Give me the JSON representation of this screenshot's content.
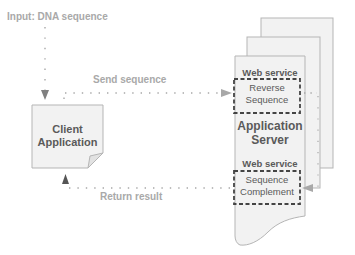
{
  "labels": {
    "input": "Input: DNA sequence",
    "send": "Send sequence",
    "return": "Return result"
  },
  "client": {
    "line1": "Client",
    "line2": "Application"
  },
  "server": {
    "line1": "Application",
    "line2": "Server",
    "services": [
      {
        "header": "Web service",
        "line1": "Reverse",
        "line2": "Sequence"
      },
      {
        "header": "Web service",
        "line1": "Sequence",
        "line2": "Complement"
      }
    ]
  },
  "colors": {
    "page_fill": "#f2f2f2",
    "page_stroke": "#b5b5b5",
    "label_gray": "#a9a9a9",
    "text_dark": "#5a5a5a",
    "dotted_line": "#a8a8a8",
    "service_border": "#444444"
  }
}
